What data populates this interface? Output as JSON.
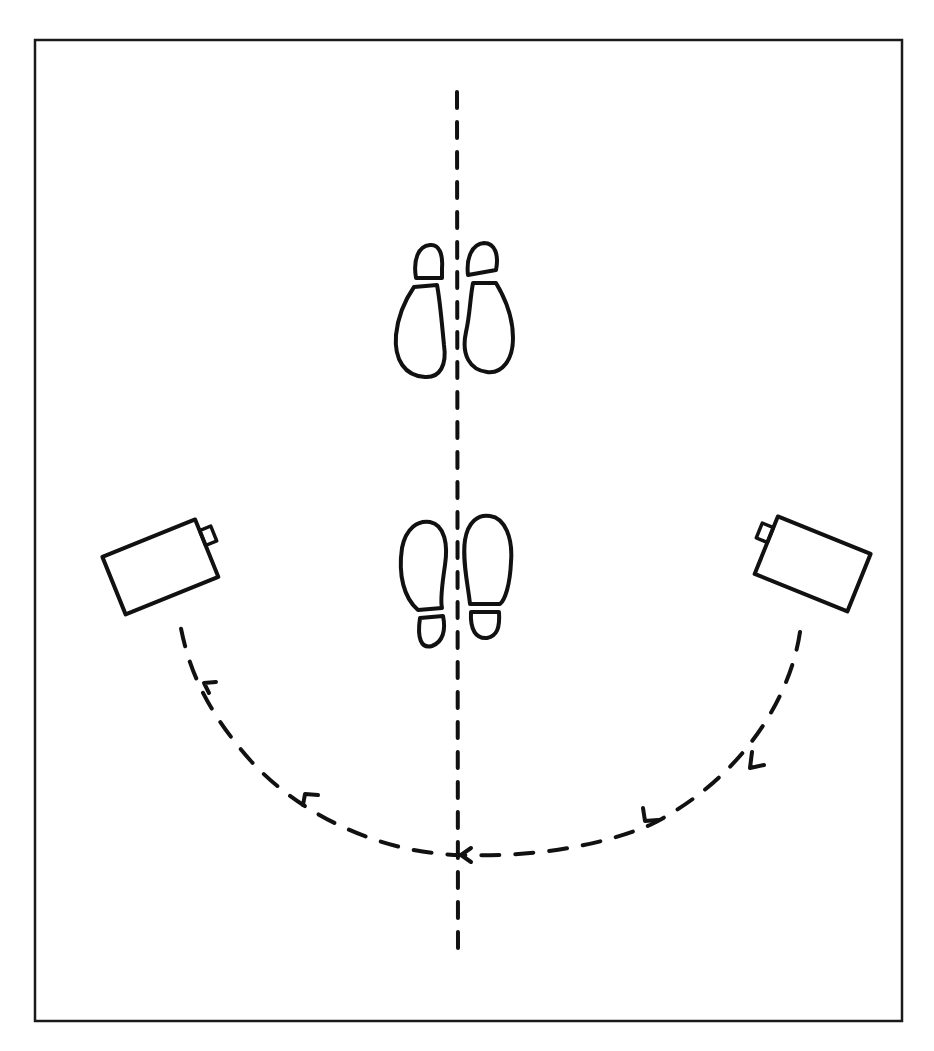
{
  "diagram": {
    "title": "Camera movement arc around subject (top-down view)",
    "colors": {
      "background": "#ffffff",
      "ink": "#111111"
    },
    "frame": {
      "x": 35,
      "y": 40,
      "width": 867,
      "height": 981
    },
    "axis_line": {
      "label": "center line",
      "x": 457,
      "y_start": 92,
      "y_end": 955,
      "style": "dashed"
    },
    "footprints": [
      {
        "label": "upper footprints",
        "pair": "left and right shoe prints",
        "position": "above center, toes pointing up"
      },
      {
        "label": "lower footprints",
        "pair": "left and right shoe prints",
        "position": "below center, toes pointing up"
      }
    ],
    "cameras": [
      {
        "label": "left camera",
        "side": "left",
        "lens_direction": "pointing toward subject (upper-right)"
      },
      {
        "label": "right camera",
        "side": "right",
        "lens_direction": "pointing toward subject (upper-left)"
      }
    ],
    "path": {
      "label": "camera dolly arc",
      "style": "dashed",
      "direction": "from right camera, down around the bottom, through center line, up to left camera",
      "arrow_count": 5
    }
  }
}
